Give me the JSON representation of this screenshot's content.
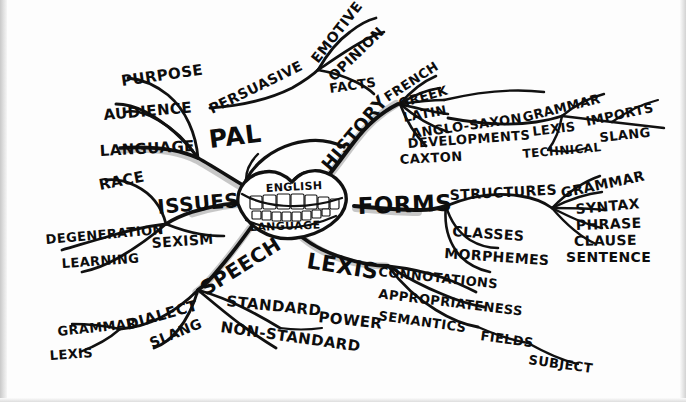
{
  "document": {
    "title": "English Language Mind Map",
    "medium": "hand-drawn ink on paper",
    "center_label_top": "ENGLISH",
    "center_label_bottom": "LANGUAGE",
    "ink_color": "#0d0d0d",
    "paper_color": "#fdfdfd"
  },
  "center": {
    "name": "English Language",
    "icon": "mouth-with-teeth"
  },
  "branches": [
    {
      "id": "pal",
      "label": "PAL",
      "children": [
        {
          "label": "PURPOSE",
          "children": []
        },
        {
          "label": "AUDIENCE",
          "children": []
        },
        {
          "label": "LANGUAGE",
          "children": []
        },
        {
          "label": "PERSUASIVE",
          "children": [
            {
              "label": "EMOTIVE"
            },
            {
              "label": "OPINION"
            },
            {
              "label": "FACTS"
            }
          ]
        }
      ]
    },
    {
      "id": "history",
      "label": "HISTORY",
      "children": [
        {
          "label": "FRENCH"
        },
        {
          "label": "GREEK"
        },
        {
          "label": "LATIN"
        },
        {
          "label": "ANGLO-SAXON"
        },
        {
          "label": "DEVELOPMENTS",
          "children": [
            {
              "label": "GRAMMAR"
            },
            {
              "label": "LEXIS",
              "children": [
                {
                  "label": "IMPORTS"
                },
                {
                  "label": "SLANG"
                },
                {
                  "label": "TECHNICAL"
                }
              ]
            }
          ]
        },
        {
          "label": "CAXTON"
        }
      ]
    },
    {
      "id": "issues",
      "label": "ISSUES",
      "children": [
        {
          "label": "RACE"
        },
        {
          "label": "DEGENERATION"
        },
        {
          "label": "LEARNING"
        },
        {
          "label": "SEXISM"
        }
      ]
    },
    {
      "id": "forms",
      "label": "FORMS",
      "children": [
        {
          "label": "STRUCTURES",
          "children": [
            {
              "label": "GRAMMAR"
            },
            {
              "label": "SYNTAX"
            },
            {
              "label": "PHRASE"
            },
            {
              "label": "CLAUSE"
            },
            {
              "label": "SENTENCE"
            }
          ]
        },
        {
          "label": "CLASSES"
        },
        {
          "label": "MORPHEMES"
        }
      ]
    },
    {
      "id": "lexis",
      "label": "LEXIS",
      "children": [
        {
          "label": "CONNOTATIONS"
        },
        {
          "label": "APPROPRIATENESS"
        },
        {
          "label": "SEMANTICS",
          "children": [
            {
              "label": "FIELDS",
              "children": [
                {
                  "label": "SUBJECT"
                }
              ]
            }
          ]
        }
      ]
    },
    {
      "id": "speech",
      "label": "SPEECH",
      "children": [
        {
          "label": "DIALECT",
          "children": [
            {
              "label": "GRAMMAR"
            },
            {
              "label": "LEXIS"
            }
          ]
        },
        {
          "label": "SLANG"
        },
        {
          "label": "STANDARD",
          "children": [
            {
              "label": "POWER"
            }
          ]
        },
        {
          "label": "NON-STANDARD"
        }
      ]
    }
  ],
  "labels": {
    "PAL": "PAL",
    "PURPOSE": "PURPOSE",
    "AUDIENCE": "AUDIENCE",
    "LANGUAGE": "LANGUAGE",
    "PERSUASIVE": "PERSUASIVE",
    "EMOTIVE": "EMOTIVE",
    "OPINION": "OPINION",
    "FACTS": "FACTS",
    "HISTORY": "HISTORY",
    "FRENCH": "FRENCH",
    "GREEK": "GREEK",
    "LATIN": "LATIN",
    "ANGLO_SAXON": "ANGLO-SAXON",
    "DEVELOPMENTS": "DEVELOPMENTS",
    "CAXTON": "CAXTON",
    "DEV_GRAMMAR": "GRAMMAR",
    "DEV_LEXIS": "LEXIS",
    "IMPORTS": "IMPORTS",
    "SLANG_HIST": "SLANG",
    "TECHNICAL": "TECHNICAL",
    "ISSUES": "ISSUES",
    "RACE": "RACE",
    "DEGENERATION": "DEGENERATION",
    "LEARNING": "LEARNING",
    "SEXISM": "SEXISM",
    "FORMS": "FORMS",
    "STRUCTURES": "STRUCTURES",
    "STR_GRAMMAR": "GRAMMAR",
    "SYNTAX": "SYNTAX",
    "PHRASE": "PHRASE",
    "CLAUSE": "CLAUSE",
    "SENTENCE": "SENTENCE",
    "CLASSES": "CLASSES",
    "MORPHEMES": "MORPHEMES",
    "LEXIS": "LEXIS",
    "CONNOTATIONS": "CONNOTATIONS",
    "APPROPRIATENESS": "APPROPRIATENESS",
    "SEMANTICS": "SEMANTICS",
    "FIELDS": "FIELDS",
    "SUBJECT": "SUBJECT",
    "SPEECH": "SPEECH",
    "DIALECT": "DIALECT",
    "SP_GRAMMAR": "GRAMMAR",
    "SP_LEXIS": "LEXIS",
    "SLANG_SPEECH": "SLANG",
    "STANDARD": "STANDARD",
    "POWER": "POWER",
    "NON_STANDARD": "NON-STANDARD",
    "ENGLISH": "ENGLISH",
    "LANGUAGE_CENTER": "LANGUAGE"
  }
}
